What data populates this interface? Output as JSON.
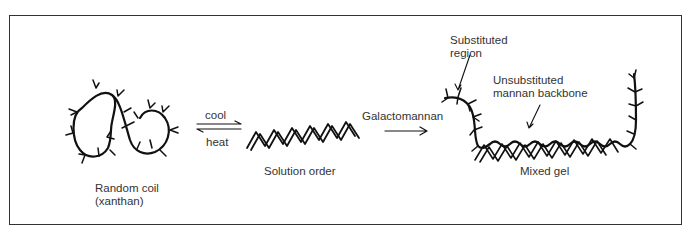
{
  "diagram": {
    "stages": [
      {
        "id": "random-coil",
        "label_line1": "Random coil",
        "label_line2": "(xanthan)"
      },
      {
        "id": "solution-order",
        "label": "Solution order"
      },
      {
        "id": "mixed-gel",
        "label": "Mixed gel"
      }
    ],
    "transition_1": {
      "forward": "cool",
      "reverse": "heat"
    },
    "transition_2": {
      "reagent": "Galactomannan"
    },
    "annotations": {
      "substituted_line1": "Substituted",
      "substituted_line2": "region",
      "unsubstituted_line1": "Unsubstituted",
      "unsubstituted_line2": "mannan backbone"
    },
    "colors": {
      "line": "#111111",
      "text": "#333333",
      "frame": "#333333"
    }
  }
}
